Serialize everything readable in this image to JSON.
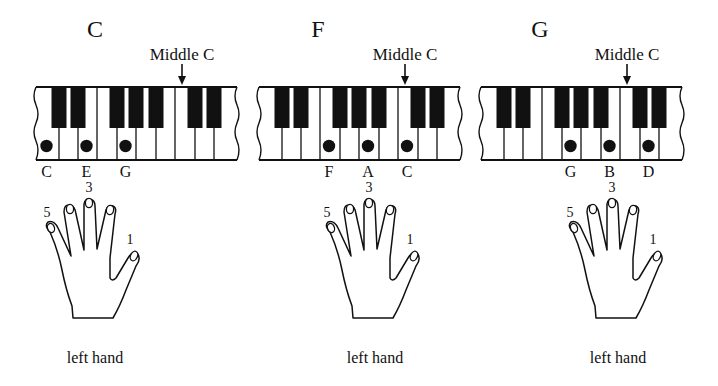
{
  "colors": {
    "ink": "#111111",
    "paper": "#ffffff"
  },
  "keyboard": {
    "white_keys": [
      "C",
      "D",
      "E",
      "F",
      "G",
      "A",
      "B",
      "C",
      "D",
      "E"
    ],
    "black_key_after_white_index": [
      0,
      1,
      3,
      4,
      5,
      7,
      8
    ],
    "middle_c_white_index": 7,
    "middle_c_label": "Middle C"
  },
  "panels": [
    {
      "chord": "C",
      "notes": [
        {
          "name": "C",
          "white_index": 0
        },
        {
          "name": "E",
          "white_index": 2
        },
        {
          "name": "G",
          "white_index": 4
        }
      ],
      "finger_label_under_note": {
        "note_index": 1,
        "label": "3"
      },
      "hand_finger_labels": {
        "pinky": "5",
        "middle": "3",
        "thumb": "1"
      },
      "caption": "left hand"
    },
    {
      "chord": "F",
      "notes": [
        {
          "name": "F",
          "white_index": 3
        },
        {
          "name": "A",
          "white_index": 5
        },
        {
          "name": "C",
          "white_index": 7
        }
      ],
      "finger_label_under_note": {
        "note_index": 1,
        "label": "3"
      },
      "hand_finger_labels": {
        "pinky": "5",
        "middle": "3",
        "thumb": "1"
      },
      "caption": "left hand"
    },
    {
      "chord": "G",
      "notes": [
        {
          "name": "G",
          "white_index": 4
        },
        {
          "name": "B",
          "white_index": 6
        },
        {
          "name": "D",
          "white_index": 8
        }
      ],
      "finger_label_under_note": {
        "note_index": 1,
        "label": "3"
      },
      "hand_finger_labels": {
        "pinky": "5",
        "middle": "3",
        "thumb": "1"
      },
      "caption": "left hand"
    }
  ]
}
